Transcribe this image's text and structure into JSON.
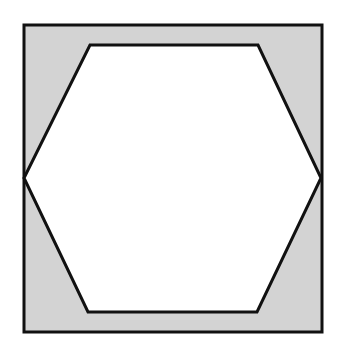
{
  "diagram": {
    "colors": {
      "background": "#ffffff",
      "shaded_region": "#d3d3d3",
      "hexagon_fill": "#ffffff",
      "stroke": "#111111"
    },
    "square": {
      "x": 24,
      "y": 25,
      "width": 298,
      "height": 307
    },
    "hexagon": {
      "points": "90,45 258,45 321,178 257,312 88,312 24,178"
    },
    "stroke_width": 3
  }
}
